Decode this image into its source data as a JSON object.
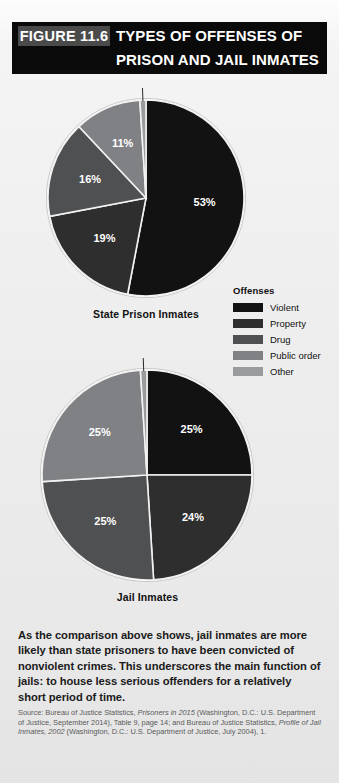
{
  "header": {
    "figure_tag": "FIGURE 11.6",
    "title_line1": "TYPES OF OFFENSES OF",
    "title_line2": "PRISON AND JAIL INMATES"
  },
  "legend": {
    "title": "Offenses",
    "items": [
      {
        "label": "Violent",
        "color": "#121212"
      },
      {
        "label": "Property",
        "color": "#2e2e2e"
      },
      {
        "label": "Drug",
        "color": "#4f5052"
      },
      {
        "label": "Public order",
        "color": "#808184"
      },
      {
        "label": "Other",
        "color": "#9a9b9d"
      }
    ]
  },
  "summary_text": "As the comparison above shows, jail inmates are more likely than state prisoners to have been convicted of nonviolent crimes. This underscores the main function of jails: to house less serious offenders for a relatively short period of time.",
  "source_parts": {
    "p1": "Source: Bureau of Justice Statistics, ",
    "i1": "Prisoners in 2015",
    "p2": " (Washington, D.C.: U.S. Department of Justice, September 2014), Table 9, page 14; and Bureau of Justice Statistics, ",
    "i2": "Profile of Jail Inmates, 2002",
    "p3": " (Washington, D.C.: U.S. Department of Justice, July 2004), 1."
  },
  "chart_data": [
    {
      "type": "pie",
      "title": "State Prison Inmates",
      "categories": [
        "Violent",
        "Property",
        "Drug",
        "Public order",
        "Other"
      ],
      "values": [
        53,
        19,
        16,
        11,
        1
      ],
      "labels": [
        "53%",
        "19%",
        "16%",
        "11%",
        "1%"
      ],
      "colors": [
        "#121212",
        "#2e2e2e",
        "#4f5052",
        "#808184",
        "#9a9b9d"
      ],
      "units": "percent",
      "legend_position": "right"
    },
    {
      "type": "pie",
      "title": "Jail Inmates",
      "categories": [
        "Violent",
        "Property",
        "Drug",
        "Public order",
        "Other"
      ],
      "values": [
        25,
        24,
        25,
        25,
        1
      ],
      "labels": [
        "25%",
        "24%",
        "25%",
        "25%",
        "1%"
      ],
      "colors": [
        "#121212",
        "#2e2e2e",
        "#4f5052",
        "#808184",
        "#9a9b9d"
      ],
      "units": "percent",
      "legend_position": "right"
    }
  ]
}
